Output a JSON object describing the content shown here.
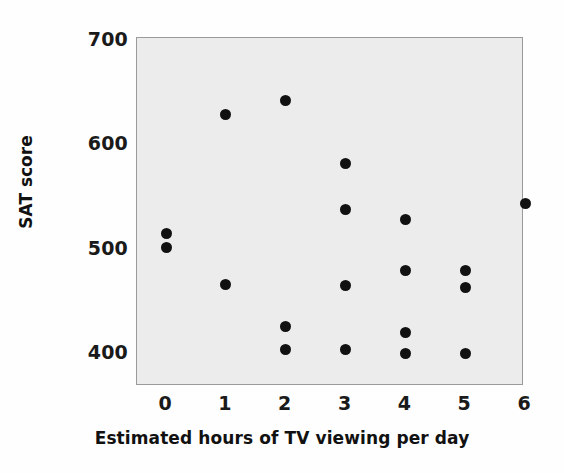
{
  "chart_data": {
    "type": "scatter",
    "title": "",
    "xlabel": "Estimated hours of TV viewing per day",
    "ylabel": "SAT score",
    "xlim": [
      -0.5,
      6.2
    ],
    "ylim": [
      358,
      700
    ],
    "xticks": [
      0,
      1,
      2,
      3,
      4,
      5,
      6
    ],
    "xtick_labels": [
      "0",
      "1",
      "2",
      "3",
      "4",
      "5",
      "6"
    ],
    "yticks": [
      400,
      500,
      600,
      700
    ],
    "ytick_labels": [
      "400",
      "500",
      "600",
      "700"
    ],
    "grid": false,
    "legend": null,
    "marker": "filled-circle",
    "marker_color": "#111111",
    "panel_color": "#ececec",
    "points": [
      {
        "x": 0,
        "y": 515
      },
      {
        "x": 0,
        "y": 501
      },
      {
        "x": 1,
        "y": 629
      },
      {
        "x": 1,
        "y": 466
      },
      {
        "x": 2,
        "y": 642
      },
      {
        "x": 2,
        "y": 425
      },
      {
        "x": 2,
        "y": 403
      },
      {
        "x": 3,
        "y": 582
      },
      {
        "x": 3,
        "y": 538
      },
      {
        "x": 3,
        "y": 465
      },
      {
        "x": 3,
        "y": 403
      },
      {
        "x": 4,
        "y": 528
      },
      {
        "x": 4,
        "y": 479
      },
      {
        "x": 4,
        "y": 420
      },
      {
        "x": 4,
        "y": 400
      },
      {
        "x": 5,
        "y": 479
      },
      {
        "x": 5,
        "y": 463
      },
      {
        "x": 5,
        "y": 400
      },
      {
        "x": 6,
        "y": 543
      }
    ]
  }
}
